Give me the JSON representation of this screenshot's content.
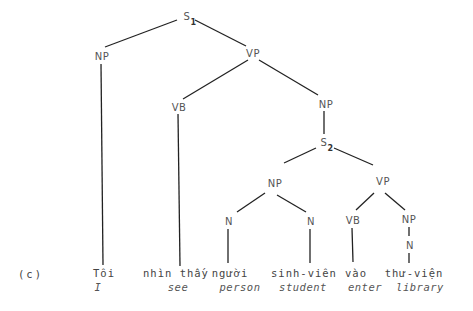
{
  "example_label": "(c)",
  "nodes": {
    "s1": {
      "label": "S",
      "sub": "1"
    },
    "np_subj": {
      "label": "NP"
    },
    "vp_main": {
      "label": "VP"
    },
    "vb_main": {
      "label": "VB"
    },
    "np_obj": {
      "label": "NP"
    },
    "s2": {
      "label": "S",
      "sub": "2"
    },
    "np_emb": {
      "label": "NP"
    },
    "vp_emb": {
      "label": "VP"
    },
    "n_person": {
      "label": "N"
    },
    "n_student": {
      "label": "N"
    },
    "vb_emb": {
      "label": "VB"
    },
    "np_lib": {
      "label": "NP"
    },
    "n_lib": {
      "label": "N"
    }
  },
  "words": [
    {
      "vn": "Tôi",
      "gloss": "I"
    },
    {
      "vn": "nhìn thấy",
      "gloss": "see"
    },
    {
      "vn": "người",
      "gloss": "person"
    },
    {
      "vn": "sinh-viên",
      "gloss": "student"
    },
    {
      "vn": "vào",
      "gloss": "enter"
    },
    {
      "vn": "thư-viện",
      "gloss": "library"
    }
  ]
}
